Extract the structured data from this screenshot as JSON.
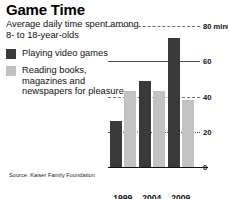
{
  "header": {
    "title": "Game Time",
    "subtitle": "Average daily time spent among 8- to 18-year-olds"
  },
  "legend": {
    "items": [
      {
        "label": "Playing video games",
        "color": "#3a3a3a",
        "swatch": "dark-swatch"
      },
      {
        "label": "Reading books, magazines and newspapers for pleasure",
        "color": "#c2c2c2",
        "swatch": "light-swatch"
      }
    ]
  },
  "source": "Source: Kaiser Family Foundation",
  "axis": {
    "ticks": [
      {
        "value": 80,
        "label": "80 minutes"
      },
      {
        "value": 60,
        "label": "60"
      },
      {
        "value": 40,
        "label": "40"
      },
      {
        "value": 20,
        "label": "20"
      },
      {
        "value": 0,
        "label": "0"
      }
    ]
  },
  "chart_data": {
    "type": "bar",
    "title": "Game Time",
    "subtitle": "Average daily time spent among 8- to 18-year-olds",
    "categories": [
      "1999",
      "2004",
      "2009"
    ],
    "series": [
      {
        "name": "Playing video games",
        "color": "#3a3a3a",
        "values": [
          26,
          49,
          73
        ]
      },
      {
        "name": "Reading books, magazines and newspapers for pleasure",
        "color": "#c2c2c2",
        "values": [
          43,
          43,
          38
        ]
      }
    ],
    "xlabel": "",
    "ylabel": "minutes",
    "ylim": [
      0,
      80
    ],
    "yticks": [
      0,
      20,
      40,
      60,
      80
    ],
    "ytick_labels": [
      "0",
      "20",
      "40",
      "60",
      "80 minutes"
    ],
    "grid": true,
    "legend_position": "left",
    "source": "Source: Kaiser Family Foundation"
  }
}
